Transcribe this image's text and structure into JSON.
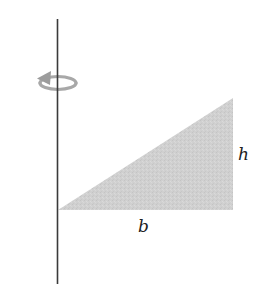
{
  "figure": {
    "labels": {
      "height": "h",
      "base": "b"
    },
    "icons": {
      "rotation": "rotation-arrow-icon"
    },
    "colors": {
      "axis": "#3a3a3a",
      "triangle_fill": "#cfcfcf",
      "rotation_arrow": "#a8a8a8",
      "label_text": "#222222",
      "background": "#ffffff"
    },
    "geometry": {
      "axis": {
        "x": 57.5,
        "y1": 19,
        "y2": 284
      },
      "triangle": {
        "points": [
          [
            58,
            210
          ],
          [
            233,
            210
          ],
          [
            233,
            98
          ]
        ]
      }
    }
  }
}
